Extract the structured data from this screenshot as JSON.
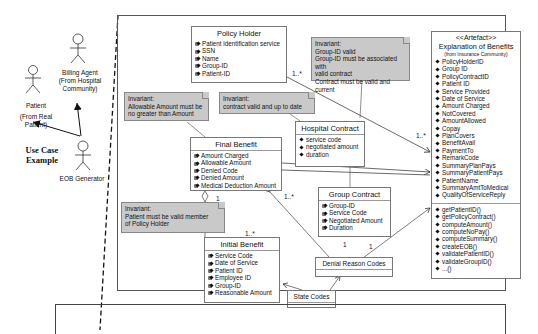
{
  "actors": {
    "billing_agent": {
      "name": "Billing Agent",
      "sub1": "(From Hospital",
      "sub2": "Community)"
    },
    "patient": {
      "name": "Patient",
      "sub": "(From Real Patient)"
    },
    "eob_generator": {
      "name": "EOB Generator"
    }
  },
  "use_case_label": {
    "line1": "Use Case",
    "line2": "Example"
  },
  "classes": {
    "policy_holder": {
      "title": "Policy Holder",
      "attributes": [
        "Patient identification service",
        "SSN",
        "Name",
        "Group-ID",
        "Patient-ID"
      ]
    },
    "final_benefit": {
      "title": "Final Benefit",
      "attributes": [
        "Amount Charged",
        "Allowable Amount",
        "Denied Code",
        "Denied Amount",
        "Medical Deduction Amount"
      ]
    },
    "hospital_contract": {
      "title": "Hospital Contract",
      "attributes": [
        "service code",
        "negotiated amount",
        "duration"
      ]
    },
    "group_contract": {
      "title": "Group Contract",
      "attributes": [
        "Group-ID",
        "Service Code",
        "Negotiated Amount",
        "Duration"
      ]
    },
    "initial_benefit": {
      "title": "Initial Benefit",
      "attributes": [
        "Service Code",
        "Date of Service",
        "Patient ID",
        "Employee ID",
        "Group-ID",
        "Reasonable Amount"
      ]
    },
    "denial_reason_codes": {
      "title": "Denial Reason Codes"
    },
    "state_codes": {
      "title": "State Codes"
    },
    "eob": {
      "stereotype": "<<Artefact>>",
      "title": "Explanation of Benefits",
      "subtitle": "(from Insurance Community)",
      "attributes": [
        "PolicyHolderID",
        "Group ID",
        "PolicyContractID",
        "Patient ID",
        "Service Provided",
        "Date of Service",
        "Amount Charged",
        "NotCovered",
        "AmountAllowed",
        "Copay",
        "PlanCovers",
        "BenefitAvail",
        "PaymentTo",
        "RemarkCode",
        "SummaryPlanPays",
        "SummaryPatientPays",
        "PatientName",
        "SummaryAmtToMedical",
        "QualityOfServiceReply"
      ],
      "operations": [
        "getPatientID()",
        "getPolicyContract()",
        "computeAmount()",
        "computeNoPay()",
        "computeSummary()",
        "createEOB()",
        "validatePatientID()",
        "validateGroupID()",
        "...()"
      ]
    }
  },
  "notes": {
    "group_invariant": {
      "lines": [
        "Invariant:",
        "Group-ID valid",
        "Group-ID must be associated with",
        "valid contract",
        "Contract must be valid and current"
      ]
    },
    "allowable_invariant": {
      "lines": [
        "Invariant:",
        "Allowable Amount must be",
        "no greater than Amount"
      ]
    },
    "contract_invariant": {
      "lines": [
        "Invariant:",
        "contract valid and up to date"
      ]
    },
    "patient_invariant": {
      "lines": [
        "Invariant:",
        "Patient must be valid member",
        "of Policy Holder"
      ]
    }
  },
  "multiplicities": {
    "policy_holder_eob": "1..*",
    "eob_hospital": "1..*",
    "final_initial_top": "1",
    "final_initial_bottom": "1..*",
    "final_group": "1..*",
    "group_denial_left": "1",
    "group_denial_right": "1"
  }
}
